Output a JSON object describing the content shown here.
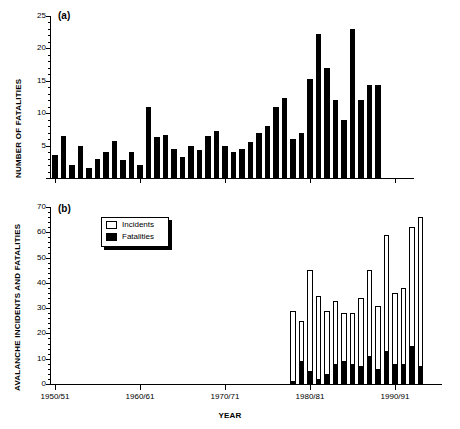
{
  "figure": {
    "xlabel": "YEAR",
    "panel_a_tag": "(a)",
    "panel_b_tag": "(b)",
    "panel_a_ylabel": "NUMBER OF FATALITIES",
    "panel_b_ylabel": "AVALANCHE INCIDENTS AND FATALITIES",
    "legend": {
      "incidents_label": "Incidents",
      "fatalities_label": "Fatalities",
      "incidents_color": "#ffffff",
      "fatalities_color": "#000000"
    },
    "xticklabels": [
      "1950/51",
      "1960/61",
      "1970/71",
      "1980/81",
      "1990/91"
    ],
    "xtickyears": [
      1950,
      1960,
      1970,
      1980,
      1990
    ]
  },
  "chart_data": [
    {
      "type": "bar",
      "title": "(a)",
      "xlabel": "YEAR",
      "ylabel": "NUMBER OF FATALITIES",
      "ylim": [
        0,
        25
      ],
      "yticks": [
        0,
        5,
        10,
        15,
        20,
        25
      ],
      "yticklabels": [
        "",
        "5",
        "10",
        "15",
        "20",
        "25"
      ],
      "xlim": [
        1949.5,
        1994.5
      ],
      "grid": false,
      "legend_position": "none",
      "bar_color": "#000000",
      "categories": [
        "1950/51",
        "1951/52",
        "1952/53",
        "1953/54",
        "1954/55",
        "1955/56",
        "1956/57",
        "1957/58",
        "1958/59",
        "1959/60",
        "1960/61",
        "1961/62",
        "1962/63",
        "1963/64",
        "1964/65",
        "1965/66",
        "1966/67",
        "1967/68",
        "1968/69",
        "1969/70",
        "1970/71",
        "1971/72",
        "1972/73",
        "1973/74",
        "1974/75",
        "1975/76",
        "1976/77",
        "1977/78",
        "1978/79",
        "1979/80",
        "1980/81",
        "1981/82",
        "1982/83",
        "1983/84",
        "1984/85",
        "1985/86",
        "1986/87",
        "1987/88",
        "1988/89"
      ],
      "x": [
        1950,
        1951,
        1952,
        1953,
        1954,
        1955,
        1956,
        1957,
        1958,
        1959,
        1960,
        1961,
        1962,
        1963,
        1964,
        1965,
        1966,
        1967,
        1968,
        1969,
        1970,
        1971,
        1972,
        1973,
        1974,
        1975,
        1976,
        1977,
        1978,
        1979,
        1980,
        1981,
        1982,
        1983,
        1984,
        1985,
        1986,
        1987,
        1988
      ],
      "values": [
        3.5,
        6.5,
        2,
        5,
        1.5,
        3,
        4,
        5.7,
        2.8,
        4,
        2,
        11,
        6.3,
        6.7,
        4.5,
        3.3,
        5,
        4.3,
        6.5,
        7.3,
        5,
        4,
        4.5,
        5.5,
        7,
        8,
        11,
        12.3,
        6,
        7,
        15.3,
        22.3,
        17,
        12,
        9,
        23,
        12,
        14.3,
        14.3
      ]
    },
    {
      "type": "bar",
      "title": "(b)",
      "stacked": true,
      "xlabel": "YEAR",
      "ylabel": "AVALANCHE INCIDENTS AND FATALITIES",
      "ylim": [
        0,
        70
      ],
      "yticks": [
        0,
        10,
        20,
        30,
        40,
        50,
        60,
        70
      ],
      "yticklabels": [
        "0",
        "10",
        "20",
        "30",
        "40",
        "50",
        "60",
        "70"
      ],
      "xlim": [
        1949.5,
        1994.5
      ],
      "grid": false,
      "legend_position": "upper-left-inset",
      "categories": [
        "1978/79",
        "1979/80",
        "1980/81",
        "1981/82",
        "1982/83",
        "1983/84",
        "1984/85",
        "1985/86",
        "1986/87",
        "1987/88",
        "1988/89",
        "1989/90",
        "1990/91",
        "1991/92",
        "1992/93",
        "1993/94"
      ],
      "x": [
        1978,
        1979,
        1980,
        1981,
        1982,
        1983,
        1984,
        1985,
        1986,
        1987,
        1988,
        1989,
        1990,
        1991,
        1992,
        1993
      ],
      "series": [
        {
          "name": "Incidents",
          "color": "#ffffff",
          "values": [
            29,
            25,
            45,
            35,
            29,
            33,
            28,
            28,
            34,
            45,
            31,
            59,
            36,
            38,
            62,
            66
          ]
        },
        {
          "name": "Fatalities",
          "color": "#000000",
          "values": [
            1,
            9,
            5,
            2,
            4,
            8,
            9,
            8,
            7,
            11,
            6,
            13,
            8,
            8,
            15,
            7
          ]
        }
      ]
    }
  ]
}
